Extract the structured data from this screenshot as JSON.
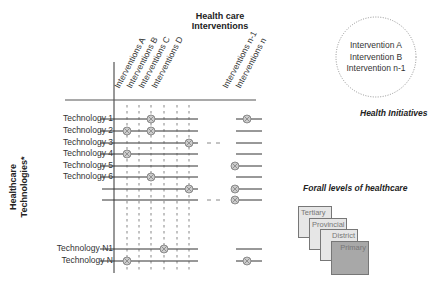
{
  "header": {
    "title_line1": "Health care",
    "title_line2": "Interventions"
  },
  "columns": [
    {
      "label": "Interventions A",
      "x": 127
    },
    {
      "label": "Interventions B",
      "x": 139
    },
    {
      "label": "Interventions C",
      "x": 151
    },
    {
      "label": "Interventions D",
      "x": 164
    },
    {
      "label": "Interventions n-1",
      "x": 235
    },
    {
      "label": "Interventions n",
      "x": 248
    }
  ],
  "y_axis_label_line1": "Healthcare",
  "y_axis_label_line2": "Technologies*",
  "rows": [
    {
      "label": "Technology 1",
      "y": 119
    },
    {
      "label": "Technology 2",
      "y": 131
    },
    {
      "label": "Technology 3",
      "y": 143
    },
    {
      "label": "Technology 4",
      "y": 154
    },
    {
      "label": "Technology 5",
      "y": 166
    },
    {
      "label": "Technology 6",
      "y": 177
    },
    {
      "label": "",
      "y": 189
    },
    {
      "label": "",
      "y": 200
    },
    {
      "label": "Technology N1",
      "y": 249
    },
    {
      "label": "Technology N",
      "y": 261
    }
  ],
  "markers": [
    {
      "row": "Technology 1",
      "x": 151
    },
    {
      "row": "Technology 1",
      "x": 247
    },
    {
      "row": "Technology 2",
      "x": 127
    },
    {
      "row": "Technology 2",
      "x": 151
    },
    {
      "row": "Technology 3",
      "x": 189
    },
    {
      "row": "Technology 4",
      "x": 127
    },
    {
      "row": "Technology 5",
      "x": 235
    },
    {
      "row": "Technology 6",
      "x": 151
    },
    {
      "row": "row 7",
      "x": 189
    },
    {
      "row": "row 7",
      "x": 235
    },
    {
      "row": "row 8",
      "x": 235
    },
    {
      "row": "Technology N1",
      "x": 164
    },
    {
      "row": "Technology N",
      "x": 127
    },
    {
      "row": "Technology N",
      "x": 247
    }
  ],
  "health_initiatives": {
    "items": [
      "Intervention  A",
      "Intervention  B",
      "Intervention  n-1"
    ],
    "label": "Health Initiatives"
  },
  "levels": {
    "title": "Forall levels of healthcare",
    "items": [
      "Tertiary",
      "Provincial",
      "District",
      "Primary"
    ]
  },
  "colors": {
    "line": "#333333",
    "marker_fill": "#cccccc",
    "primary_fill": "#a8a8a8",
    "level_fill": "#e6e6e6"
  }
}
